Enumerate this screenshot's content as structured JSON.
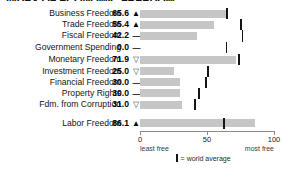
{
  "title": "INDEX OF ECONOMIC FREEDOM",
  "chart_data": {
    "type": "bar",
    "title": "INDEX OF ECONOMIC FREEDOM",
    "xlabel": "",
    "ylabel": "",
    "xlim": [
      0,
      100
    ],
    "grid": false,
    "orientation": "horizontal",
    "axis_ticks": [
      0,
      50,
      100
    ],
    "axis_tick_labels": [
      "0",
      "50",
      "100"
    ],
    "axis_left_caption": "least free",
    "axis_right_caption": "most free",
    "legend": "= world average",
    "categories": [
      "Business Freedom",
      "Trade Freedom",
      "Fiscal Freedom",
      "Government Spending",
      "Monetary Freedom",
      "Investment Freedom",
      "Financial Freedom",
      "Property Rights",
      "Fdm. from Corruption",
      "Labor Freedom"
    ],
    "values": [
      65.6,
      55.4,
      42.2,
      0.0,
      71.9,
      25.0,
      30.0,
      30.0,
      31.0,
      86.1
    ],
    "value_labels": [
      "65.6",
      "55.4",
      "42.2",
      "0.0",
      "71.9",
      "25.0",
      "30.0",
      "30.0",
      "31.0",
      "86.1"
    ],
    "trend_indicators": [
      "up",
      "up",
      "flat",
      "flat",
      "down",
      "down",
      "flat",
      "flat",
      "down",
      "up"
    ],
    "trend_glyphs": [
      "▲",
      "▲",
      "—",
      "—",
      "▽",
      "▽",
      "—",
      "—",
      "▽",
      "▲"
    ],
    "world_average": [
      64.3,
      74.8,
      76.0,
      64.0,
      73.4,
      50.2,
      48.5,
      43.6,
      40.5,
      62.1
    ],
    "series": [
      {
        "name": "country score",
        "values": [
          65.6,
          55.4,
          42.2,
          0.0,
          71.9,
          25.0,
          30.0,
          30.0,
          31.0,
          86.1
        ]
      },
      {
        "name": "world average",
        "values": [
          64.3,
          74.8,
          76.0,
          64.0,
          73.4,
          50.2,
          48.5,
          43.6,
          40.5,
          62.1
        ]
      }
    ],
    "colors": {
      "bar": "#c6c6c6",
      "tick": "#151515",
      "axis": "#8a8a8a"
    }
  },
  "rows": [
    {
      "label": "Business Freedom",
      "value": "65.6",
      "glyph": "▲",
      "trend": "up"
    },
    {
      "label": "Trade Freedom",
      "value": "55.4",
      "glyph": "▲",
      "trend": "up"
    },
    {
      "label": "Fiscal Freedom",
      "value": "42.2",
      "glyph": "—",
      "trend": "flat"
    },
    {
      "label": "Government Spending",
      "value": "0.0",
      "glyph": "—",
      "trend": "flat"
    },
    {
      "label": "Monetary Freedom",
      "value": "71.9",
      "glyph": "▽",
      "trend": "down"
    },
    {
      "label": "Investment Freedom",
      "value": "25.0",
      "glyph": "▽",
      "trend": "down"
    },
    {
      "label": "Financial Freedom",
      "value": "30.0",
      "glyph": "—",
      "trend": "flat"
    },
    {
      "label": "Property Rights",
      "value": "30.0",
      "glyph": "—",
      "trend": "flat"
    },
    {
      "label": "Fdm. from Corruption",
      "value": "31.0",
      "glyph": "▽",
      "trend": "down"
    },
    {
      "label": "Labor Freedom",
      "value": "86.1",
      "glyph": "▲",
      "trend": "up"
    }
  ],
  "axis": {
    "tick0": "0",
    "tick50": "50",
    "tick100": "100",
    "least": "least free",
    "most": "most free"
  },
  "legend": {
    "text": "= world average"
  }
}
